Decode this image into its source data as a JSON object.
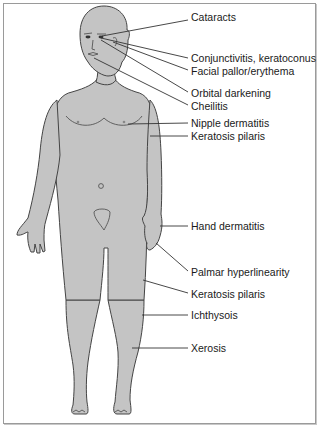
{
  "figure": {
    "colors": {
      "body_fill": "#c4c4c4",
      "outline": "#444444",
      "leader_line": "#333333",
      "text": "#1a1a1a",
      "frame": "#9a9a9a"
    },
    "labels": [
      {
        "text": "Cataracts",
        "x": 191,
        "y": 17
      },
      {
        "text": "Conjunctivitis, keratoconus",
        "x": 191,
        "y": 55
      },
      {
        "text": "Facial pallor/erythema",
        "x": 191,
        "y": 67
      },
      {
        "text": "Orbital darkening",
        "x": 191,
        "y": 89
      },
      {
        "text": "Cheilitis",
        "x": 191,
        "y": 102
      },
      {
        "text": "Nipple dermatitis",
        "x": 191,
        "y": 117
      },
      {
        "text": "Keratosis pilaris",
        "x": 191,
        "y": 131
      },
      {
        "text": "Hand dermatitis",
        "x": 191,
        "y": 221
      },
      {
        "text": "Palmar hyperlinearity",
        "x": 191,
        "y": 266
      },
      {
        "text": "Keratosis pilaris",
        "x": 191,
        "y": 288
      },
      {
        "text": "Ichthysois",
        "x": 191,
        "y": 310
      },
      {
        "text": "Xerosis",
        "x": 191,
        "y": 343
      }
    ]
  }
}
